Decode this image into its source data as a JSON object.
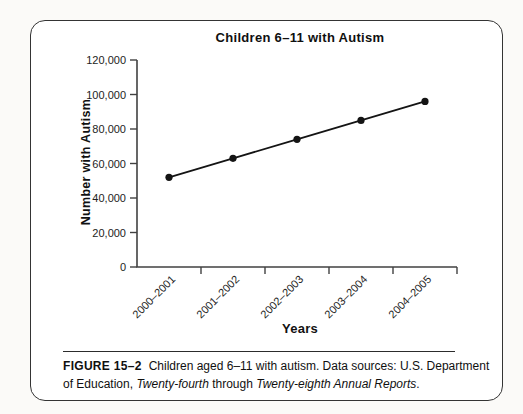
{
  "figure_box": {
    "caption": {
      "label": "FIGURE 15–2",
      "line1_text": "Children aged 6–11 with autism. Data sources: U.S. Department",
      "line2_text1": "of Education, ",
      "line2_italic1": "Twenty-fourth",
      "line2_text2": " through ",
      "line2_italic2": "Twenty-eighth Annual Reports",
      "line2_text3": "."
    }
  },
  "chart_data": {
    "type": "line",
    "title": "Children 6–11 with Autism",
    "xlabel": "Years",
    "ylabel": "Number with Autism",
    "categories": [
      "2000–2001",
      "2001–2002",
      "2002–2003",
      "2003–2004",
      "2004–2005"
    ],
    "values": [
      52000,
      63000,
      74000,
      85000,
      96000
    ],
    "series": [
      {
        "name": "Children 6–11 with autism",
        "values": [
          52000,
          63000,
          74000,
          85000,
          96000
        ]
      }
    ],
    "ylim": [
      0,
      120000
    ],
    "ytick_step": 20000,
    "ytick_labels": [
      "0",
      "20,000",
      "40,000",
      "60,000",
      "80,000",
      "100,000",
      "120,000"
    ],
    "grid": false,
    "legend": "none",
    "marker": "filled-circle",
    "line_color": "#141414",
    "axis_color": "#414141",
    "text_color": "#1d1d1d"
  }
}
